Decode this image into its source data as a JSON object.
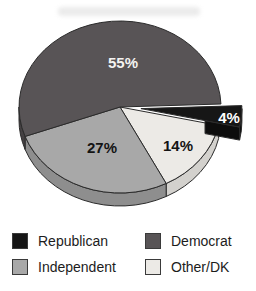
{
  "chart_data": {
    "type": "pie",
    "title": "",
    "unit": "%",
    "style": "3d-exploded",
    "slices": [
      {
        "label": "Republican",
        "value": 4,
        "display": "4%",
        "color": "#161616",
        "side_color": "#0d0d0d",
        "text_color": "#ffffff",
        "exploded": true,
        "label_pos": [
          229,
          118
        ]
      },
      {
        "label": "Other/DK",
        "value": 14,
        "display": "14%",
        "color": "#eceae6",
        "side_color": "#d3d1cd",
        "text_color": "#141414",
        "exploded": false,
        "label_pos": [
          178,
          146
        ]
      },
      {
        "label": "Independent",
        "value": 27,
        "display": "27%",
        "color": "#a8a8a8",
        "side_color": "#8e8e8e",
        "text_color": "#141414",
        "exploded": false,
        "label_pos": [
          102,
          148
        ]
      },
      {
        "label": "Democrat",
        "value": 55,
        "display": "55%",
        "color": "#585456",
        "side_color": "#454143",
        "text_color": "#f4f3f1",
        "exploded": false,
        "label_pos": [
          123,
          63
        ]
      }
    ],
    "layout": {
      "cx": 120,
      "cy": 107,
      "rx": 101,
      "ry": 86,
      "depth": 13,
      "start_angle": -2,
      "clockwise": true,
      "explode_offset": 21,
      "stroke": "#2b2b2b",
      "background": "#ffffff"
    },
    "legend": {
      "position": "bottom",
      "columns": 2,
      "items": [
        {
          "label": "Republican",
          "color": "#161616"
        },
        {
          "label": "Independent",
          "color": "#a8a8a8"
        },
        {
          "label": "Democrat",
          "color": "#585456"
        },
        {
          "label": "Other/DK",
          "color": "#eceae6"
        }
      ]
    }
  }
}
